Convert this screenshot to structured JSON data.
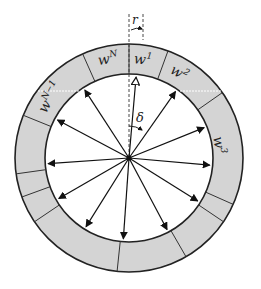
{
  "diagram": {
    "center": {
      "x": 129,
      "y": 158
    },
    "outer_radius": 114,
    "inner_radius": 84,
    "ring_fill": "#d4d4d4",
    "stroke": "#222222",
    "segment_boundaries_deg": [
      0,
      20,
      55,
      114,
      124,
      150,
      186,
      236,
      250,
      262,
      292,
      336
    ],
    "highlight_lines": [
      {
        "y": 91,
        "x1": 38,
        "x2": 80
      },
      {
        "y": 91,
        "x1": 180,
        "x2": 222
      }
    ],
    "arrows_deg": [
      5,
      35,
      68,
      95,
      122,
      152,
      184,
      212,
      240,
      266,
      298,
      327
    ],
    "open_arrow_deg": 5,
    "labels": {
      "w1": {
        "base": "w",
        "sup": "1"
      },
      "w2": {
        "base": "w",
        "sup": "2"
      },
      "w3": {
        "base": "w",
        "sup": "3"
      },
      "wN": {
        "base": "w",
        "sup": "N"
      },
      "wN_1": {
        "base": "w",
        "sup": "N−1"
      },
      "r": "r",
      "delta": "δ"
    }
  }
}
